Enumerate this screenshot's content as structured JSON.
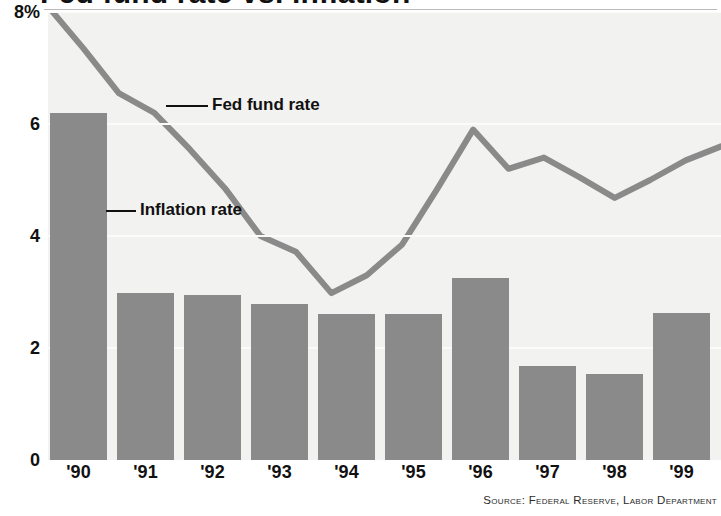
{
  "header": {
    "title_clipped": "Fed fund rate vs. inflation",
    "source_note": "Source: Federal Reserve, Labor Department"
  },
  "annotations": {
    "line_label": "Fed fund rate",
    "bar_label": "Inflation rate"
  },
  "colors": {
    "bar": "#8a8a8a",
    "line": "#8a8a8a",
    "plot_background": "#f2f2f0",
    "gridline": "#fbfbfa",
    "text": "#111111"
  },
  "chart_data": {
    "type": "bar",
    "title": "Fed fund rate vs. inflation",
    "xlabel": "",
    "ylabel": "",
    "ylim": [
      0,
      8
    ],
    "yticks": [
      0,
      2,
      4,
      6,
      8
    ],
    "ytick_labels": [
      "0",
      "2",
      "4",
      "6",
      "8%"
    ],
    "grid": true,
    "legend": "inline annotations",
    "categories": [
      "'90",
      "'91",
      "'92",
      "'93",
      "'94",
      "'95",
      "'96",
      "'97",
      "'98",
      "'99"
    ],
    "series": [
      {
        "name": "Inflation rate",
        "type": "bar",
        "values": [
          6.2,
          2.98,
          2.95,
          2.78,
          2.6,
          2.6,
          3.25,
          1.68,
          1.53,
          2.62
        ]
      },
      {
        "name": "Fed fund rate",
        "type": "line",
        "x": [
          "'90.0",
          "'90.6",
          "'91.3",
          "'91.9",
          "'92.3",
          "'92.8",
          "'93.3",
          "'93.9",
          "'94.4",
          "'94.8",
          "'95.3",
          "'95.8",
          "'96.3",
          "'96.8",
          "'97.2",
          "'97.6",
          "'98.2",
          "'98.8",
          "'99.4",
          "'99.9"
        ],
        "values": [
          8.1,
          7.35,
          6.55,
          6.2,
          5.55,
          4.85,
          4.0,
          3.72,
          2.98,
          3.3,
          3.85,
          4.85,
          5.9,
          5.2,
          5.4,
          5.05,
          4.68,
          5.0,
          5.35,
          5.6
        ]
      }
    ]
  }
}
